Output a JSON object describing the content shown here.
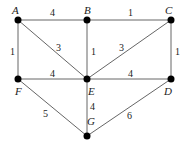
{
  "graph": {
    "nodes": [
      {
        "id": "A",
        "label": "A",
        "x": 18,
        "y": 20,
        "lx": 12,
        "ly": 14
      },
      {
        "id": "B",
        "label": "B",
        "x": 87,
        "y": 20,
        "lx": 84,
        "ly": 14
      },
      {
        "id": "C",
        "label": "C",
        "x": 171,
        "y": 20,
        "lx": 165,
        "ly": 14
      },
      {
        "id": "F",
        "label": "F",
        "x": 18,
        "y": 79,
        "lx": 15,
        "ly": 95
      },
      {
        "id": "E",
        "label": "E",
        "x": 87,
        "y": 79,
        "lx": 88,
        "ly": 95
      },
      {
        "id": "D",
        "label": "D",
        "x": 171,
        "y": 79,
        "lx": 164,
        "ly": 95
      },
      {
        "id": "G",
        "label": "G",
        "x": 87,
        "y": 136,
        "lx": 87,
        "ly": 125
      }
    ],
    "edges": [
      {
        "from": "A",
        "to": "B",
        "weight": "4",
        "wx": 50,
        "wy": 16
      },
      {
        "from": "B",
        "to": "C",
        "weight": "1",
        "wx": 128,
        "wy": 16
      },
      {
        "from": "A",
        "to": "F",
        "weight": "1",
        "wx": 10,
        "wy": 55
      },
      {
        "from": "A",
        "to": "E",
        "weight": "3",
        "wx": 56,
        "wy": 51
      },
      {
        "from": "B",
        "to": "E",
        "weight": "1",
        "wx": 91,
        "wy": 55
      },
      {
        "from": "C",
        "to": "E",
        "weight": "3",
        "wx": 119,
        "wy": 51
      },
      {
        "from": "C",
        "to": "D",
        "weight": "1",
        "wx": 175,
        "wy": 55
      },
      {
        "from": "F",
        "to": "E",
        "weight": "4",
        "wx": 50,
        "wy": 77
      },
      {
        "from": "E",
        "to": "D",
        "weight": "4",
        "wx": 128,
        "wy": 77
      },
      {
        "from": "E",
        "to": "G",
        "weight": "4",
        "wx": 90,
        "wy": 110
      },
      {
        "from": "F",
        "to": "G",
        "weight": "5",
        "wx": 43,
        "wy": 117
      },
      {
        "from": "D",
        "to": "G",
        "weight": "6",
        "wx": 127,
        "wy": 119
      }
    ]
  }
}
